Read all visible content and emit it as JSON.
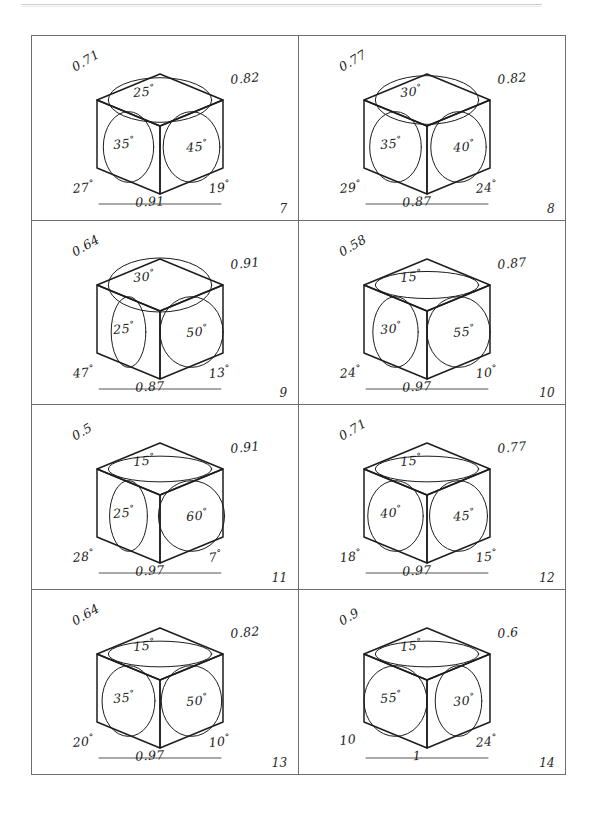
{
  "page": {
    "type": "worksheet-figure-sheet",
    "ink_color": "#1d1d1d",
    "rule_color": "#6e6e6e",
    "paper_color": "#ffffff",
    "columns": 2,
    "rows": 4
  },
  "figures": [
    {
      "number": "7",
      "edge_left": "0.71",
      "edge_right": "0.82",
      "angle_top": "25",
      "angle_left": "35",
      "angle_right": "45",
      "base_angle_left": "27",
      "base_angle_right": "19",
      "base_value": "0.91",
      "base_angle_left_has_degree": true,
      "base_angle_right_has_degree": true,
      "top_ellipse_ry": 0.33,
      "left_ellipse_rx": 0.8,
      "right_ellipse_rx": 0.9
    },
    {
      "number": "8",
      "edge_left": "0.77",
      "edge_right": "0.82",
      "angle_top": "30",
      "angle_left": "35",
      "angle_right": "40",
      "base_angle_left": "29",
      "base_angle_right": "24",
      "base_value": "0.87",
      "base_angle_left_has_degree": true,
      "base_angle_right_has_degree": true,
      "top_ellipse_ry": 0.36,
      "left_ellipse_rx": 0.82,
      "right_ellipse_rx": 0.88
    },
    {
      "number": "9",
      "edge_left": "0.64",
      "edge_right": "0.91",
      "angle_top": "30",
      "angle_left": "25",
      "angle_right": "50",
      "base_angle_left": "47",
      "base_angle_right": "13",
      "base_value": "0.87",
      "base_angle_left_has_degree": true,
      "base_angle_right_has_degree": true,
      "top_ellipse_ry": 0.4,
      "left_ellipse_rx": 0.55,
      "right_ellipse_rx": 1.0
    },
    {
      "number": "10",
      "edge_left": "0.58",
      "edge_right": "0.87",
      "angle_top": "15",
      "angle_left": "30",
      "angle_right": "55",
      "base_angle_left": "24",
      "base_angle_right": "10",
      "base_value": "0.97",
      "base_angle_left_has_degree": true,
      "base_angle_right_has_degree": true,
      "top_ellipse_ry": 0.2,
      "left_ellipse_rx": 0.72,
      "right_ellipse_rx": 1.0
    },
    {
      "number": "11",
      "edge_left": "0.5",
      "edge_right": "0.91",
      "angle_top": "15",
      "angle_left": "25",
      "angle_right": "60",
      "base_angle_left": "28",
      "base_angle_right": "7",
      "base_value": "0.97",
      "base_angle_left_has_degree": true,
      "base_angle_right_has_degree": true,
      "top_ellipse_ry": 0.19,
      "left_ellipse_rx": 0.6,
      "right_ellipse_rx": 1.05
    },
    {
      "number": "12",
      "edge_left": "0.71",
      "edge_right": "0.77",
      "angle_top": "15",
      "angle_left": "40",
      "angle_right": "45",
      "base_angle_left": "18",
      "base_angle_right": "15",
      "base_value": "0.97",
      "base_angle_left_has_degree": true,
      "base_angle_right_has_degree": true,
      "top_ellipse_ry": 0.19,
      "left_ellipse_rx": 0.88,
      "right_ellipse_rx": 0.92
    },
    {
      "number": "13",
      "edge_left": "0.64",
      "edge_right": "0.82",
      "angle_top": "15",
      "angle_left": "35",
      "angle_right": "50",
      "base_angle_left": "20",
      "base_angle_right": "10",
      "base_value": "0.97",
      "base_angle_left_has_degree": true,
      "base_angle_right_has_degree": true,
      "top_ellipse_ry": 0.19,
      "left_ellipse_rx": 0.84,
      "right_ellipse_rx": 0.96
    },
    {
      "number": "14",
      "edge_left": "0.9",
      "edge_right": "0.6",
      "angle_top": "15",
      "angle_left": "55",
      "angle_right": "30",
      "base_angle_left": "10",
      "base_angle_right": "24",
      "base_value": "1",
      "base_angle_left_has_degree": false,
      "base_angle_right_has_degree": true,
      "top_ellipse_ry": 0.19,
      "left_ellipse_rx": 1.0,
      "right_ellipse_rx": 0.74
    }
  ]
}
